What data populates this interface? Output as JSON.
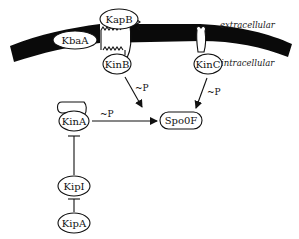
{
  "diagram": {
    "type": "signaling-pathway",
    "regions": {
      "extracellular": "extracellular",
      "intracellular": "intracellular"
    },
    "nodes": {
      "kbaA": "KbaA",
      "kapB": "KapB",
      "kinB": "KinB",
      "kinC": "KinC",
      "kinA": "KinA",
      "spo0F": "Spo0F",
      "kipI": "KipI",
      "kipA": "KipA"
    },
    "edges": [
      {
        "from": "KinB",
        "to": "Spo0F",
        "type": "activation",
        "label": "~P"
      },
      {
        "from": "KinC",
        "to": "Spo0F",
        "type": "activation",
        "label": "~P"
      },
      {
        "from": "KinA",
        "to": "Spo0F",
        "type": "activation",
        "label": "~P"
      },
      {
        "from": "KipI",
        "to": "KinA",
        "type": "inhibition",
        "label": ""
      },
      {
        "from": "KipA",
        "to": "KipI",
        "type": "inhibition",
        "label": ""
      }
    ],
    "edge_labels": {
      "kinB_spo0F": "~P",
      "kinC_spo0F": "~P",
      "kinA_spo0F": "~P"
    },
    "colors": {
      "membrane": "#0a0a0a",
      "stroke": "#111111",
      "background": "#ffffff"
    }
  }
}
